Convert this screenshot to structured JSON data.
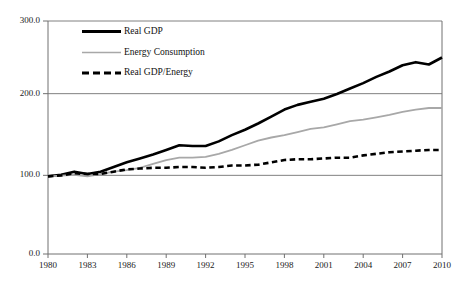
{
  "chart_data": {
    "type": "line",
    "title": "",
    "subtitle": "",
    "xlabel": "",
    "ylabel": "",
    "xlim": [
      1980,
      2010
    ],
    "ylim": [
      0.0,
      300.0
    ],
    "grid": true,
    "gridlines_y": [
      100.0,
      200.0,
      300.0
    ],
    "legend_position": "top-left-inside",
    "y_ticks": [
      "0.0",
      "100.0",
      "200.0",
      "300.0"
    ],
    "y_tick_values": [
      0.0,
      100.0,
      200.0,
      300.0
    ],
    "x_ticks": [
      "1980",
      "1983",
      "1986",
      "1989",
      "1992",
      "1995",
      "1998",
      "2001",
      "2004",
      "2007",
      "2010"
    ],
    "x_tick_values": [
      1980,
      1983,
      1986,
      1989,
      1992,
      1995,
      1998,
      2001,
      2004,
      2007,
      2010
    ],
    "x": [
      1980,
      1981,
      1982,
      1983,
      1984,
      1985,
      1986,
      1987,
      1988,
      1989,
      1990,
      1991,
      1992,
      1993,
      1994,
      1995,
      1996,
      1997,
      1998,
      1999,
      2000,
      2001,
      2002,
      2003,
      2004,
      2005,
      2006,
      2007,
      2008,
      2009,
      2010
    ],
    "series": [
      {
        "name": "Real GDP",
        "color": "#000000",
        "style": "solid",
        "width": 2.6,
        "values": [
          100,
          102,
          106,
          103,
          106,
          112,
          118,
          123,
          128,
          134,
          140,
          139,
          139,
          145,
          153,
          160,
          168,
          177,
          186,
          192,
          196,
          200,
          206,
          213,
          220,
          228,
          235,
          243,
          247,
          244,
          253
        ]
      },
      {
        "name": "Energy Consumption",
        "color": "#a8a8a8",
        "style": "solid",
        "width": 1.8,
        "values": [
          100,
          101,
          102,
          100,
          103,
          106,
          108,
          111,
          116,
          121,
          124,
          124,
          125,
          129,
          134,
          140,
          146,
          150,
          153,
          157,
          161,
          163,
          167,
          171,
          173,
          176,
          179,
          183,
          186,
          188,
          188
        ]
      },
      {
        "name": "Real GDP/Energy",
        "color": "#000000",
        "style": "dashed",
        "width": 2.6,
        "values": [
          100,
          101,
          104,
          103,
          103,
          106,
          109,
          110,
          111,
          111,
          112,
          112,
          111,
          112,
          114,
          114,
          115,
          118,
          121,
          122,
          122,
          123,
          124,
          124,
          127,
          129,
          131,
          132,
          133,
          134,
          134
        ]
      }
    ]
  },
  "legend": {
    "items": [
      {
        "label": "Real GDP"
      },
      {
        "label": "Energy Consumption"
      },
      {
        "label": "Real GDP/Energy"
      }
    ]
  },
  "axes": {
    "y_tick_0": "0.0",
    "y_tick_1": "100.0",
    "y_tick_2": "200.0",
    "y_tick_3": "300.0"
  }
}
